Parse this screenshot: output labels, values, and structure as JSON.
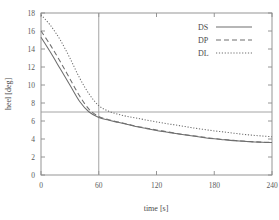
{
  "chart_data": {
    "type": "line",
    "title": "",
    "subtitle": "",
    "xlabel": "time [s]",
    "ylabel": "heel [deg]",
    "xlim": [
      0,
      240
    ],
    "ylim": [
      0,
      18
    ],
    "xticks": [
      0,
      60,
      120,
      180,
      240
    ],
    "yticks": [
      0,
      2,
      4,
      6,
      8,
      10,
      12,
      14,
      16,
      18
    ],
    "xtick_labels": [
      "0",
      "60",
      "120",
      "180",
      "240"
    ],
    "ytick_labels": [
      "0",
      "2",
      "4",
      "6",
      "8",
      "10",
      "12",
      "14",
      "16",
      "18"
    ],
    "grid": false,
    "legend_position": "top-right",
    "legend_entries": [
      "DS",
      "DP",
      "DL"
    ],
    "reference_lines": [
      {
        "name": "heel-threshold",
        "orientation": "horizontal",
        "value": 7,
        "label": ""
      },
      {
        "name": "time-marker",
        "orientation": "vertical",
        "value": 60,
        "label": ""
      }
    ],
    "x": [
      0,
      10,
      20,
      30,
      40,
      50,
      60,
      70,
      80,
      90,
      100,
      110,
      120,
      130,
      140,
      150,
      160,
      170,
      180,
      190,
      200,
      210,
      220,
      230,
      240
    ],
    "series": [
      {
        "name": "DS",
        "style": "solid",
        "color": "#6e6e6e",
        "values": [
          15.3,
          13.6,
          11.8,
          10.0,
          8.2,
          7.0,
          6.4,
          6.1,
          5.85,
          5.6,
          5.35,
          5.15,
          4.95,
          4.78,
          4.6,
          4.45,
          4.3,
          4.15,
          4.02,
          3.92,
          3.82,
          3.74,
          3.68,
          3.63,
          3.6
        ]
      },
      {
        "name": "DP",
        "style": "dashed",
        "color": "#6e6e6e",
        "values": [
          16.0,
          14.4,
          12.6,
          10.7,
          8.8,
          7.3,
          6.5,
          6.15,
          5.9,
          5.65,
          5.4,
          5.2,
          5.0,
          4.82,
          4.64,
          4.48,
          4.33,
          4.18,
          4.05,
          3.95,
          3.85,
          3.77,
          3.7,
          3.65,
          3.62
        ]
      },
      {
        "name": "DL",
        "style": "dotted",
        "color": "#6e6e6e",
        "values": [
          17.8,
          16.6,
          15.0,
          13.0,
          10.8,
          9.0,
          7.7,
          7.1,
          6.75,
          6.5,
          6.3,
          6.1,
          5.9,
          5.72,
          5.55,
          5.38,
          5.2,
          5.05,
          4.9,
          4.78,
          4.65,
          4.52,
          4.42,
          4.33,
          4.25
        ]
      }
    ]
  }
}
